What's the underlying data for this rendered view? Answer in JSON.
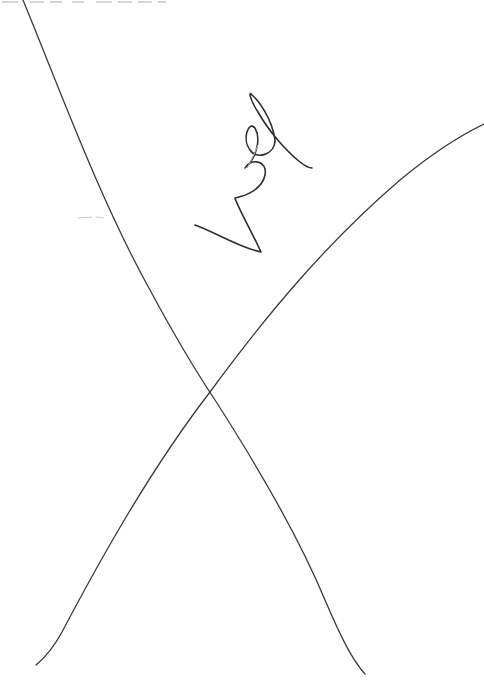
{
  "page": {
    "type": "scanned-document-page",
    "background_color": "#ffffff",
    "ink_color": "#3a3a3a"
  },
  "header_fragment": {
    "text": "",
    "note": "cropped-illegible"
  },
  "annotations": {
    "strike_through": "X",
    "signature_initials": "handwritten"
  }
}
